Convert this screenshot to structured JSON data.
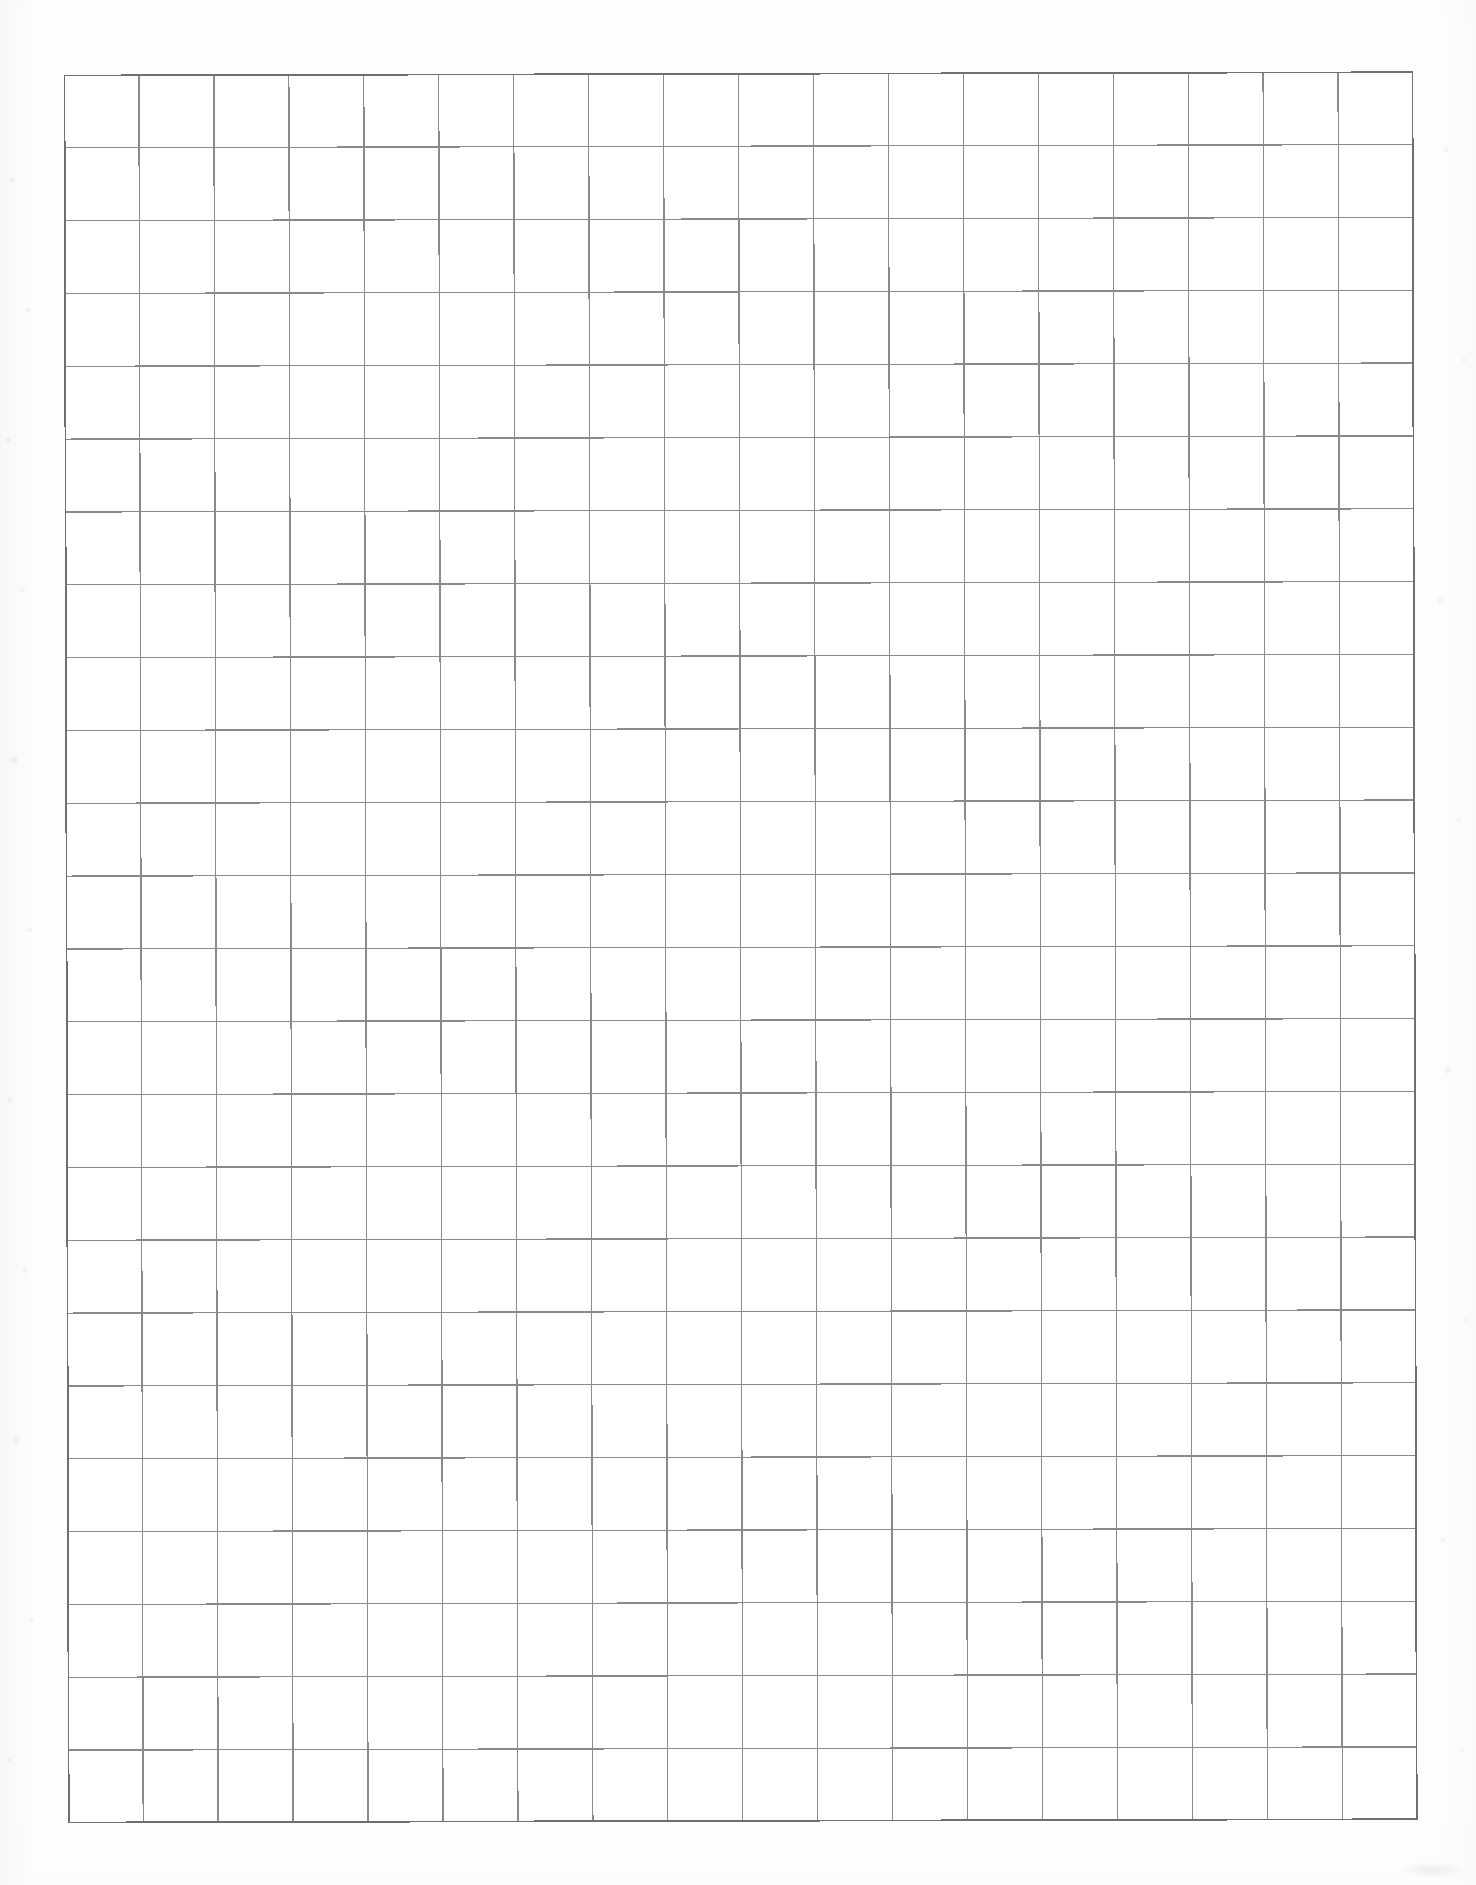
{
  "document": {
    "type": "scanned-grid-paper",
    "page_width": 1476,
    "page_height": 1885,
    "background_color": "#fefefe",
    "visible_text": ""
  },
  "grid": {
    "origin_x": 64,
    "origin_y": 75,
    "columns": 18,
    "rows": 24,
    "cell_width": 74.9,
    "cell_height": 72.8,
    "total_width": 1349,
    "total_height": 1748,
    "line_color": "#8a8a8c",
    "border_color": "#6f6f72",
    "line_width": 1.3,
    "border_width": 1.7,
    "skew_degrees": -0.14
  },
  "margins": {
    "left": 64,
    "top": 75,
    "right": 63,
    "bottom": 62
  },
  "scan_artifacts": {
    "left_speckle_label": "scanner-noise-left-margin",
    "right_speckle_label": "scanner-noise-right-margin",
    "bottom_right_smudge_label": "scanner-smudge-bottom-right",
    "paper_tone_label": "paper-illumination-falloff"
  },
  "chart_data": {
    "type": "table",
    "title": "",
    "xlabel": "",
    "ylabel": "",
    "columns": 18,
    "rows": 24,
    "categories": [],
    "values": [],
    "grid": true,
    "legend": "none",
    "note": "Blank grid / graph paper: 18 columns by 24 rows of empty cells; no data plotted, no labels, no annotations."
  }
}
